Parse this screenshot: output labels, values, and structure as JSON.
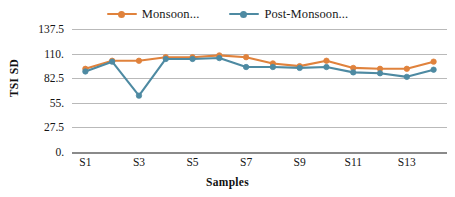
{
  "chart_data": {
    "type": "line",
    "title": "",
    "xlabel": "Samples",
    "ylabel": "TSI SD",
    "ylim": [
      0,
      137.5
    ],
    "ytick_labels": [
      "137.5",
      "110.",
      "82.5",
      "55.",
      "27.5",
      "0."
    ],
    "ytick_values": [
      137.5,
      110,
      82.5,
      55,
      27.5,
      0
    ],
    "grid": true,
    "legend_position": "top-center",
    "categories": [
      "S1",
      "S2",
      "S3",
      "S4",
      "S5",
      "S6",
      "S7",
      "S8",
      "S9",
      "S10",
      "S11",
      "S12",
      "S13",
      "S14"
    ],
    "xtick_labels_shown": [
      "S1",
      "S3",
      "S5",
      "S7",
      "S9",
      "S11",
      "S13"
    ],
    "series": [
      {
        "name": "Monsoon...",
        "color": "#E0823C",
        "values": [
          93,
          102,
          102,
          106,
          106,
          108,
          106,
          99,
          96,
          102,
          94,
          93,
          93,
          101
        ]
      },
      {
        "name": "Post-Monsoon...",
        "color": "#4E8AA2",
        "values": [
          90,
          101,
          63,
          104,
          104,
          105,
          95,
          95,
          94,
          95,
          89,
          88,
          84,
          92
        ]
      }
    ]
  },
  "legend": {
    "items": [
      {
        "label": "Monsoon...",
        "color": "#E0823C"
      },
      {
        "label": "Post-Monsoon...",
        "color": "#4E8AA2"
      }
    ]
  },
  "axes": {
    "y_title": "TSI SD",
    "x_title": "Samples"
  },
  "colors": {
    "gridline": "#b9b9b9",
    "axis": "#8a8a8a",
    "background": "#ffffff",
    "text": "#151515"
  }
}
